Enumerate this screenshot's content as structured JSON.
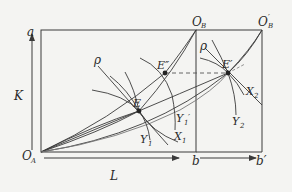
{
  "diagram": {
    "type": "edgeworth-box",
    "colors": {
      "line": "#3a3a3a",
      "background": "#f4f4f2",
      "dashed": "#555555"
    },
    "labels": {
      "origin_a": "O",
      "origin_a_sub": "A",
      "origin_b": "O",
      "origin_b_sub": "B",
      "origin_b_prime": "O",
      "origin_b_prime_sub": "B",
      "origin_b_prime_mark": "′",
      "axis_top": "a",
      "axis_k": "K",
      "axis_l": "L",
      "b": "b",
      "b_prime": "b′",
      "rho_left": "ρ",
      "rho_right": "ρ",
      "e": "E",
      "e_double_prime": "E″",
      "e_prime": "E′",
      "y1": "Y",
      "y1_sub": "1",
      "y1_prime": "Y",
      "y1_prime_sub": "1",
      "y1_prime_mark": "′",
      "x1": "X",
      "x1_sub": "1",
      "x2": "X",
      "x2_sub": "2",
      "y2": "Y",
      "y2_sub": "2"
    },
    "points": {
      "O_A": [
        41,
        152
      ],
      "O_B": [
        196,
        30
      ],
      "O_B_prime": [
        262,
        30
      ],
      "E": [
        139,
        111
      ],
      "E_double_prime": [
        165,
        73
      ],
      "E_prime": [
        228,
        73
      ]
    }
  }
}
